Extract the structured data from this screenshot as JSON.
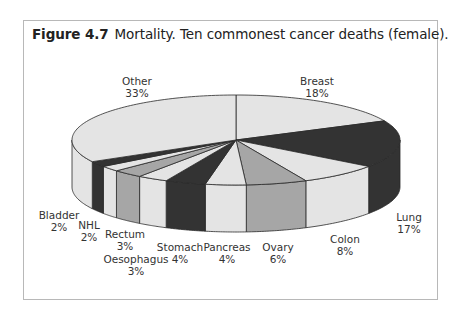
{
  "figure": {
    "number": "Figure 4.7",
    "caption": "Mortality. Ten commonest cancer deaths (female)."
  },
  "colors": {
    "light": "#e4e4e4",
    "mid": "#a6a6a6",
    "dark": "#333333",
    "outline": "#2a2a2a",
    "frame": "#b8b8b8"
  },
  "chart_data": {
    "type": "pie",
    "style": "3d",
    "title": "Mortality. Ten commonest cancer deaths (female).",
    "start": "12 o'clock, clockwise",
    "slices": [
      {
        "label": "Breast",
        "value": 18,
        "display": "18%",
        "shade": "light",
        "lx": 317,
        "ly": 75
      },
      {
        "label": "Lung",
        "value": 17,
        "display": "17%",
        "shade": "dark",
        "lx": 409,
        "ly": 211
      },
      {
        "label": "Colon",
        "value": 8,
        "display": "8%",
        "shade": "light",
        "lx": 345,
        "ly": 233
      },
      {
        "label": "Ovary",
        "value": 6,
        "display": "6%",
        "shade": "mid",
        "lx": 278,
        "ly": 241
      },
      {
        "label": "Pancreas",
        "value": 4,
        "display": "4%",
        "shade": "light",
        "lx": 227,
        "ly": 241
      },
      {
        "label": "Stomach",
        "value": 4,
        "display": "4%",
        "shade": "dark",
        "lx": 180,
        "ly": 241
      },
      {
        "label": "Oesophagus",
        "value": 3,
        "display": "3%",
        "shade": "light",
        "lx": 136,
        "ly": 253
      },
      {
        "label": "Rectum",
        "value": 3,
        "display": "3%",
        "shade": "mid",
        "lx": 125,
        "ly": 228
      },
      {
        "label": "NHL",
        "value": 2,
        "display": "2%",
        "shade": "light",
        "lx": 89,
        "ly": 219
      },
      {
        "label": "Bladder",
        "value": 2,
        "display": "2%",
        "shade": "dark",
        "lx": 59,
        "ly": 209
      },
      {
        "label": "Other",
        "value": 33,
        "display": "33%",
        "shade": "light",
        "lx": 137,
        "ly": 75
      }
    ],
    "geometry": {
      "cx": 236,
      "cy": 140,
      "rx": 164,
      "ry": 45,
      "depth": 47
    }
  }
}
